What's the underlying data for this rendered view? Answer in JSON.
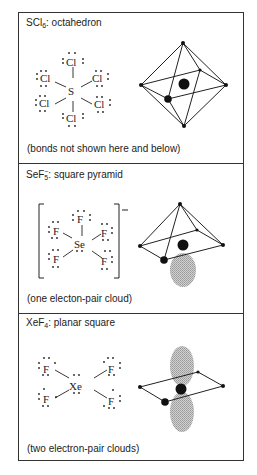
{
  "panels": [
    {
      "id": "scl6",
      "formula_base": "SCl",
      "formula_sub": "6",
      "formula_sup": "",
      "geometry": "octahedron",
      "title_suffix": ": octahedron",
      "caption": "(bonds not shown here and below)",
      "central_atom": "S",
      "ligand": "Cl",
      "ligand_count": 6,
      "lone_pair_clouds": 0
    },
    {
      "id": "sef5",
      "formula_base": "SeF",
      "formula_sub": "5",
      "formula_sup": "−",
      "geometry": "square pyramid",
      "title_suffix": ": square pyramid",
      "caption": "(one electon-pair cloud)",
      "central_atom": "Se",
      "ligand": "F",
      "ligand_count": 5,
      "charge": "−",
      "lone_pair_clouds": 1
    },
    {
      "id": "xef4",
      "formula_base": "XeF",
      "formula_sub": "4",
      "formula_sup": "",
      "geometry": "planar square",
      "title_suffix": ": planar square",
      "caption": "(two electron-pair clouds)",
      "central_atom": "Xe",
      "ligand": "F",
      "ligand_count": 4,
      "lone_pair_clouds": 2
    }
  ],
  "colors": {
    "line": "#222222",
    "atom": "#111111",
    "cloud": "#b8b8b8",
    "border": "#333333"
  }
}
